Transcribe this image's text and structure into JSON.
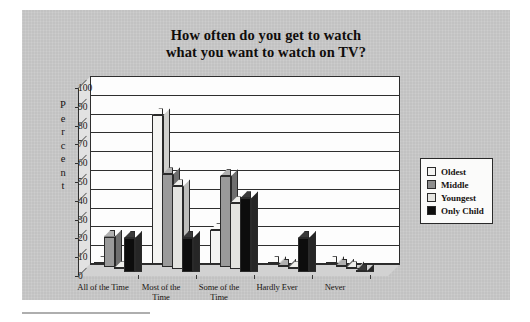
{
  "chart_data": {
    "type": "bar",
    "title": "How often do you get to watch what you want to watch on TV?",
    "title_line1": "How often do you get to watch",
    "title_line2": "what you want to watch on TV?",
    "xlabel": "",
    "ylabel": "Percent",
    "ylim": [
      0,
      100
    ],
    "ytick_step": 10,
    "grid": true,
    "legend_position": "right",
    "style": "3d-clustered-column",
    "categories": [
      "All of the Time",
      "Most of the Time",
      "Some of the Time",
      "Hardly Ever",
      "Never"
    ],
    "series": [
      {
        "name": "Oldest",
        "color": "#f4f4f2",
        "values": [
          0,
          79,
          18,
          0,
          0
        ]
      },
      {
        "name": "Middle",
        "color": "#8d8d8d",
        "values": [
          16,
          49,
          48,
          0,
          0
        ]
      },
      {
        "name": "Youngest",
        "color": "#e4e4e0",
        "values": [
          0,
          44,
          35,
          0,
          0
        ]
      },
      {
        "name": "Only Child",
        "color": "#0d0d0d",
        "values": [
          18,
          18,
          39,
          18,
          0
        ]
      }
    ],
    "yticks": [
      "100",
      "90",
      "80",
      "70",
      "60",
      "50",
      "40",
      "30",
      "20",
      "10",
      "0"
    ],
    "ylabel_letters": [
      "P",
      "e",
      "r",
      "c",
      "e",
      "n",
      "t"
    ],
    "category_lines": [
      {
        "l1": "All of the Time",
        "l2": ""
      },
      {
        "l1": "Most of the",
        "l2": "Time"
      },
      {
        "l1": "Some of the",
        "l2": "Time"
      },
      {
        "l1": "Hardly Ever",
        "l2": ""
      },
      {
        "l1": "Never",
        "l2": ""
      }
    ]
  },
  "legend": {
    "items": [
      {
        "label": "Oldest"
      },
      {
        "label": "Middle"
      },
      {
        "label": "Youngest"
      },
      {
        "label": "Only Child"
      }
    ]
  },
  "colors": {
    "page_background": "#ffffff",
    "panel_background": "#c9c9c9",
    "plot_background": "#fdfdfd",
    "axis": "#2a2a2a",
    "text": "#14110f"
  }
}
